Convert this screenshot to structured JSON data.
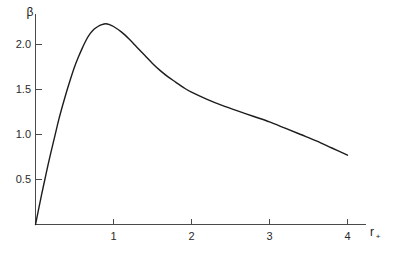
{
  "chart_data": {
    "type": "line",
    "title": "",
    "subtitle": "",
    "xlabel": "r",
    "xlabel_sub": "+",
    "ylabel": "β",
    "xlim": [
      0,
      4.25
    ],
    "ylim": [
      0,
      2.45
    ],
    "xticks": [
      1,
      2,
      3,
      4
    ],
    "xtick_labels": [
      "1",
      "2",
      "3",
      "4"
    ],
    "yticks": [
      0.5,
      1.0,
      1.5,
      2.0
    ],
    "ytick_labels": [
      "0.5",
      "1.0",
      "1.5",
      "2.0"
    ],
    "grid": false,
    "legend": "none",
    "series": [
      {
        "name": "beta",
        "color": "#1c1c1c",
        "x": [
          0.0,
          0.04,
          0.08,
          0.12,
          0.16,
          0.2,
          0.25,
          0.3,
          0.35,
          0.4,
          0.45,
          0.5,
          0.55,
          0.6,
          0.65,
          0.7,
          0.75,
          0.8,
          0.85,
          0.9,
          0.95,
          1.0,
          1.1,
          1.2,
          1.3,
          1.4,
          1.5,
          1.6,
          1.7,
          1.8,
          1.9,
          2.0,
          2.2,
          2.4,
          2.6,
          2.8,
          3.0,
          3.2,
          3.4,
          3.6,
          3.8,
          4.0
        ],
        "y": [
          0.0,
          0.17,
          0.34,
          0.5,
          0.66,
          0.81,
          0.99,
          1.17,
          1.33,
          1.48,
          1.62,
          1.75,
          1.86,
          1.96,
          2.05,
          2.12,
          2.17,
          2.2,
          2.22,
          2.23,
          2.22,
          2.2,
          2.14,
          2.06,
          1.97,
          1.88,
          1.79,
          1.71,
          1.64,
          1.58,
          1.52,
          1.47,
          1.39,
          1.32,
          1.26,
          1.2,
          1.14,
          1.07,
          1.0,
          0.93,
          0.85,
          0.77
        ]
      }
    ],
    "annotations": [],
    "peak": {
      "x": 0.9,
      "y": 2.23
    },
    "endpoint": {
      "x": 4.0,
      "y": 0.77
    }
  },
  "axes": {
    "y_axis_label": "β",
    "x_axis_label": "r",
    "x_axis_label_subscript": "+"
  }
}
